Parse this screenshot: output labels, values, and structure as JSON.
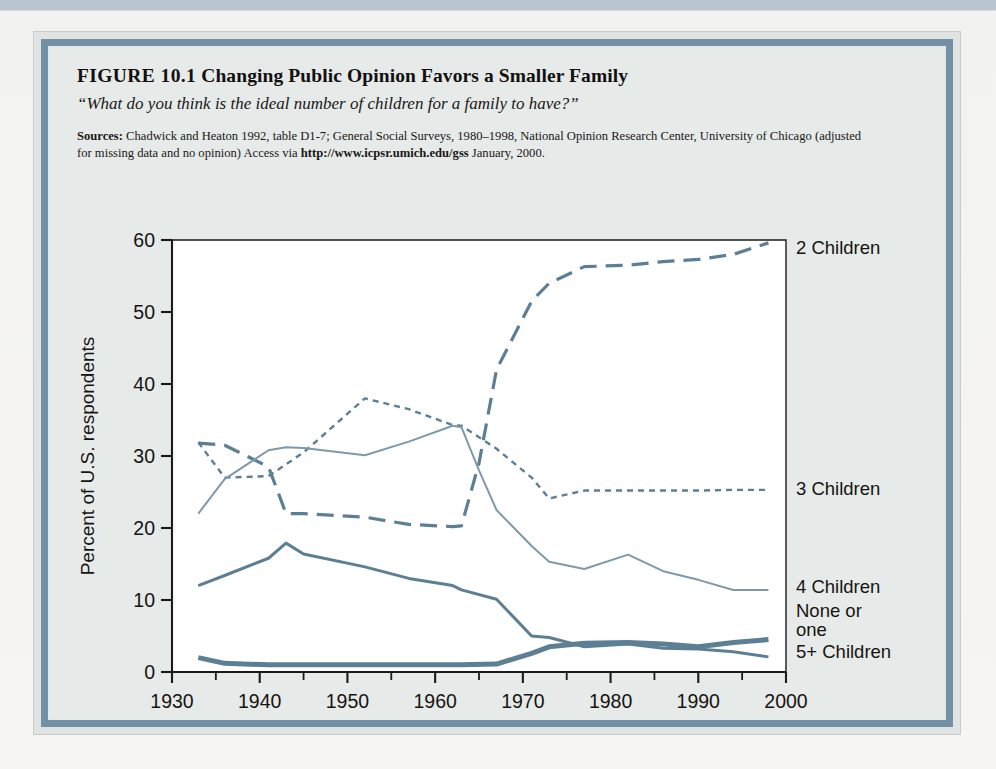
{
  "figure": {
    "label": "FIGURE 10.1",
    "title": "Changing Public Opinion Favors a Smaller Family",
    "subtitle": "“What do you think is the ideal number of children for a family to have?”",
    "sources_label": "Sources:",
    "sources_part1": " Chadwick and Heaton 1992, table D1-7; General Social Surveys, 1980–1998, National Opinion Research Center, University of Chicago (adjusted for missing data and no opinion) Access via ",
    "sources_url": "http://www.icpsr.umich.edu/gss",
    "sources_part2": " January, 2000."
  },
  "colors": {
    "line": "#5d7f95",
    "line_light": "#7e99ab",
    "frame": "#7390a6",
    "plate": "#e6eae9",
    "plot_bg": "#ffffff",
    "axis": "#1a1a1a",
    "text": "#17140f"
  },
  "chart_data": {
    "type": "line",
    "title": "Changing Public Opinion Favors a Smaller Family",
    "xlabel": "",
    "ylabel": "Percent of U.S. respondents",
    "xlim": [
      1930,
      2000
    ],
    "ylim": [
      0,
      60
    ],
    "xticks": [
      1930,
      1940,
      1950,
      1960,
      1970,
      1980,
      1990,
      2000
    ],
    "yticks": [
      0,
      10,
      20,
      30,
      40,
      50,
      60
    ],
    "xtick_labels": [
      "1930",
      "1940",
      "1950",
      "1960",
      "1970",
      "1980",
      "1990",
      "2000"
    ],
    "ytick_labels": [
      "0",
      "10",
      "20",
      "30",
      "40",
      "50",
      "60"
    ],
    "minor_xticks": [
      1935,
      1945,
      1955,
      1965,
      1975,
      1985,
      1995
    ],
    "grid": false,
    "legend_position": "right-inline",
    "series": [
      {
        "name": "2 Children",
        "label": "2 Children",
        "style": "dashed-long",
        "width": 3.2,
        "color": "#5d7f95",
        "x": [
          1933,
          1936,
          1941,
          1943,
          1945,
          1952,
          1957,
          1962,
          1963,
          1965,
          1967,
          1971,
          1973,
          1977,
          1982,
          1986,
          1990,
          1994,
          1998
        ],
        "y": [
          31.8,
          31.5,
          28.5,
          22.0,
          22.0,
          21.5,
          20.5,
          20.2,
          20.3,
          29.0,
          42.0,
          51.5,
          54.0,
          56.3,
          56.5,
          57.0,
          57.3,
          58.0,
          59.6
        ]
      },
      {
        "name": "3 Children",
        "label": "3 Children",
        "style": "dotted-short",
        "width": 2.4,
        "color": "#5d7f95",
        "x": [
          1933,
          1936,
          1941,
          1945,
          1952,
          1957,
          1962,
          1963,
          1967,
          1971,
          1973,
          1977,
          1982,
          1986,
          1990,
          1994,
          1998
        ],
        "y": [
          31.9,
          27.0,
          27.2,
          30.5,
          38.0,
          36.5,
          34.3,
          34.2,
          31.0,
          27.0,
          24.1,
          25.2,
          25.2,
          25.2,
          25.2,
          25.3,
          25.3
        ]
      },
      {
        "name": "4 Children",
        "label": "4 Children",
        "style": "solid-thin",
        "width": 2.0,
        "color": "#7e99ab",
        "x": [
          1933,
          1936,
          1941,
          1943,
          1945,
          1952,
          1957,
          1962,
          1963,
          1965,
          1967,
          1971,
          1973,
          1977,
          1982,
          1986,
          1990,
          1994,
          1998
        ],
        "y": [
          22.0,
          26.8,
          30.8,
          31.2,
          31.1,
          30.1,
          32.0,
          34.2,
          34.0,
          28.0,
          22.5,
          17.5,
          15.3,
          14.3,
          16.3,
          14.0,
          12.8,
          11.4,
          11.4
        ]
      },
      {
        "name": "5+ Children",
        "label": "5+ Children",
        "style": "solid-medium",
        "width": 3.0,
        "color": "#5d7f95",
        "x": [
          1933,
          1936,
          1941,
          1943,
          1945,
          1952,
          1957,
          1962,
          1963,
          1967,
          1971,
          1973,
          1977,
          1982,
          1986,
          1990,
          1994,
          1998
        ],
        "y": [
          12.0,
          13.4,
          15.8,
          17.9,
          16.4,
          14.6,
          13.0,
          12.0,
          11.4,
          10.1,
          5.0,
          4.8,
          3.5,
          3.9,
          3.3,
          3.2,
          2.8,
          2.1
        ]
      },
      {
        "name": "None or one",
        "label": "None or one",
        "style": "solid-thick",
        "width": 5.0,
        "color": "#5d7f95",
        "x": [
          1933,
          1936,
          1941,
          1945,
          1952,
          1957,
          1962,
          1963,
          1967,
          1971,
          1973,
          1977,
          1982,
          1986,
          1990,
          1994,
          1998
        ],
        "y": [
          2.0,
          1.2,
          1.0,
          1.0,
          1.0,
          1.0,
          1.0,
          1.0,
          1.1,
          2.6,
          3.5,
          4.0,
          4.1,
          3.9,
          3.5,
          4.1,
          4.5
        ]
      }
    ],
    "series_labels": [
      {
        "text": "2 Children",
        "x": 2001,
        "y": 59.0
      },
      {
        "text": "3 Children",
        "x": 2001,
        "y": 25.6
      },
      {
        "text": "4 Children",
        "x": 2001,
        "y": 11.9
      },
      {
        "text": "None or",
        "x": 2001,
        "y": 8.6
      },
      {
        "text": "one",
        "x": 2001,
        "y": 6.0
      },
      {
        "text": "5+ Children",
        "x": 2001,
        "y": 2.9
      }
    ]
  }
}
